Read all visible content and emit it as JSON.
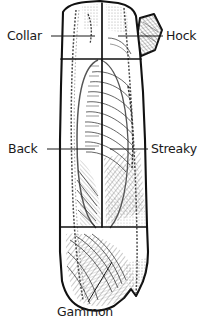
{
  "figure": {
    "background_color": "#ffffff",
    "line_color": "#111111",
    "text_color": "#1a1a1a"
  },
  "labels": [
    {
      "id": "collar",
      "text": "Collar",
      "position": "top-left",
      "text_x": 7,
      "text_y": 40,
      "leader": "M 51 36 L 95 36",
      "anchor": "start"
    },
    {
      "id": "hock",
      "text": "Hock",
      "position": "top-right",
      "text_x": 166,
      "text_y": 40,
      "leader": "M 163 36 L 118 36",
      "anchor": "start"
    },
    {
      "id": "back",
      "text": "Back",
      "position": "middle-left",
      "text_x": 8,
      "text_y": 153,
      "leader": "M 47 149 L 95 149",
      "anchor": "start"
    },
    {
      "id": "streaky",
      "text": "Streaky",
      "position": "middle-right",
      "text_x": 151,
      "text_y": 153,
      "leader": "M 148 149 L 110 149",
      "anchor": "start"
    },
    {
      "id": "gammon",
      "text": "Gammon",
      "position": "bottom-center",
      "text_x": 57,
      "text_y": 316,
      "leader": "M 88 302 L 112 262",
      "anchor": "start"
    }
  ],
  "cut_sections": [
    {
      "id": "collar-section",
      "name": "Collar",
      "region": "upper band above first divider"
    },
    {
      "id": "hock-section",
      "name": "Hock",
      "region": "diamond shaped protrusion upper right"
    },
    {
      "id": "back-streaky-section",
      "name": "Back and Streaky",
      "region": "central band between dividers"
    },
    {
      "id": "gammon-section",
      "name": "Gammon",
      "region": "rounded lower section"
    }
  ],
  "dividers": {
    "upper_y": 59,
    "lower_y": 227,
    "vertical_x": 102
  }
}
